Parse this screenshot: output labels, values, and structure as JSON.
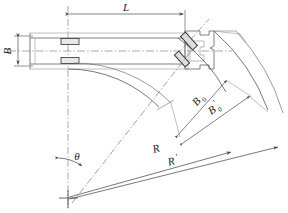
{
  "diagram": {
    "type": "engineering-line-drawing",
    "canvas": {
      "width": 288,
      "height": 213
    },
    "colors": {
      "line": "#4a4a4a",
      "line_light": "#8c8c8c",
      "centerline": "#555555",
      "text": "#1a1a1a",
      "background": "#ffffff",
      "hatch": "#6e6e6e"
    },
    "labels": {
      "length": "L",
      "width": "B",
      "swept_width": "B",
      "swept_width_sub": "0",
      "swept_width_outer": "B",
      "swept_width_outer_sub": "0",
      "swept_width_outer_prime": "′",
      "radius": "R",
      "radius_outer": "R",
      "radius_outer_prime": "′",
      "angle": "θ"
    },
    "geometry": {
      "pivot_center": {
        "x": 68,
        "y": 198
      },
      "vehicle_centerline_y": 51,
      "vehicle_body": {
        "x": 30,
        "y": 33,
        "width": 155,
        "height": 36
      },
      "dimension_L": {
        "x1": 68,
        "x2": 185,
        "y": 14
      },
      "dimension_B": {
        "x": 18,
        "y1": 36,
        "y2": 66
      },
      "turn_angle_deg": 45,
      "radius_inner_px": 152,
      "radius_outer_px": 186,
      "arc_inner_px": 118,
      "arc_outer_px": 135
    },
    "elements": [
      "vehicle-body",
      "front-wheel-pair",
      "articulated-joint",
      "trailer-unit",
      "inner-swept-arc",
      "outer-swept-arc",
      "radius-line-R",
      "radius-line-R-prime",
      "angle-arc-theta",
      "dimension-L",
      "dimension-B",
      "dimension-B0",
      "dimension-B0-prime"
    ]
  }
}
